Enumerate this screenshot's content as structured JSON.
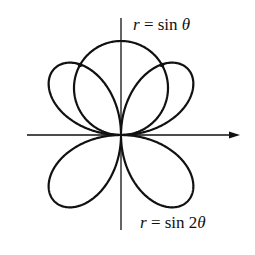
{
  "figure": {
    "type": "polar-curves",
    "origin": [
      121,
      135
    ],
    "scale": 94,
    "stroke_color": "#111111",
    "background": "#ffffff",
    "axes": {
      "x_axis": {
        "from": [
          27,
          135
        ],
        "to": [
          240,
          135
        ],
        "arrow": true
      },
      "y_axis": {
        "from": [
          121,
          18
        ],
        "to": [
          121,
          230
        ],
        "arrow": false
      }
    },
    "curves": [
      {
        "name": "circle",
        "equation": "r = sin θ"
      },
      {
        "name": "four-leaved-rose",
        "equation": "r = sin 2θ"
      }
    ],
    "intersection_points": [
      [
        80,
        65
      ],
      [
        162,
        65
      ]
    ]
  },
  "labels": {
    "circle": {
      "r": "r",
      "eq": " = sin ",
      "theta": "θ"
    },
    "rose": {
      "r": "r",
      "eq": " = sin 2",
      "theta": "θ"
    }
  }
}
